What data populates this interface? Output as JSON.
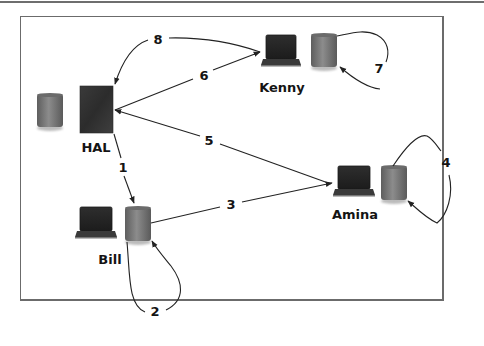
{
  "diagram": {
    "nodes": [
      {
        "id": "hal",
        "label": "HAL",
        "devices": [
          "database-cylinder",
          "server-tower"
        ]
      },
      {
        "id": "kenny",
        "label": "Kenny",
        "devices": [
          "laptop",
          "database-cylinder"
        ]
      },
      {
        "id": "amina",
        "label": "Amina",
        "devices": [
          "laptop",
          "database-cylinder"
        ]
      },
      {
        "id": "bill",
        "label": "Bill",
        "devices": [
          "laptop",
          "database-cylinder"
        ]
      }
    ],
    "edges": [
      {
        "label": "1",
        "from": "HAL",
        "to": "Bill"
      },
      {
        "label": "2",
        "from": "Bill",
        "to": "Bill"
      },
      {
        "label": "3",
        "from": "Bill",
        "to": "Amina"
      },
      {
        "label": "4",
        "from": "Amina",
        "to": "Amina"
      },
      {
        "label": "5",
        "from": "Amina",
        "to": "HAL"
      },
      {
        "label": "6",
        "from": "HAL",
        "to": "Kenny"
      },
      {
        "label": "7",
        "from": "Kenny",
        "to": "Kenny"
      },
      {
        "label": "8",
        "from": "Kenny",
        "to": "HAL"
      }
    ]
  },
  "labels": {
    "hal": "HAL",
    "kenny": "Kenny",
    "amina": "Amina",
    "bill": "Bill",
    "e1": "1",
    "e2": "2",
    "e3": "3",
    "e4": "4",
    "e5": "5",
    "e6": "6",
    "e7": "7",
    "e8": "8"
  },
  "colors": {
    "frame": "#6b6b6b",
    "edge": "#222222",
    "cylinder": "#7a7a7a",
    "server": "#3a3a3a",
    "laptop": "#2a2a2a"
  }
}
